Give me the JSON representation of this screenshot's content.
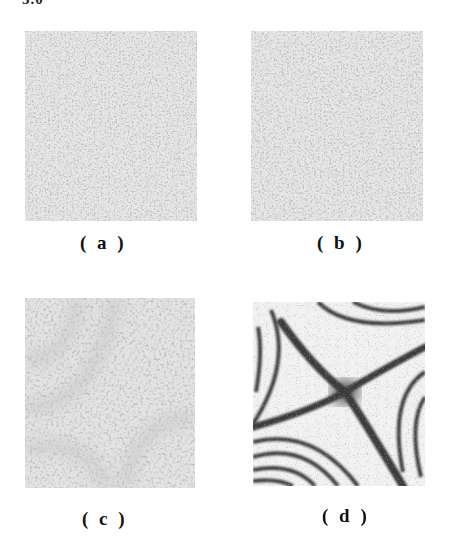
{
  "figure": {
    "top_text": "5.0",
    "panels": [
      {
        "id": "a",
        "label": "( a )",
        "content": "speckle pattern, no visible fringes"
      },
      {
        "id": "b",
        "label": "( b )",
        "content": "speckle pattern, no visible fringes"
      },
      {
        "id": "c",
        "label": "( c )",
        "content": "speckle pattern with faint fringe structure"
      },
      {
        "id": "d",
        "label": "( d )",
        "content": "hyperbolic (saddle-shaped) interference fringes with dark X at center"
      }
    ],
    "colors": {
      "background": "#ffffff",
      "speckle_light": "#e4e4e4",
      "speckle_dark": "#8a8a8a",
      "fringe_dark": "#3a3a3a",
      "label_text": "#111111"
    }
  }
}
